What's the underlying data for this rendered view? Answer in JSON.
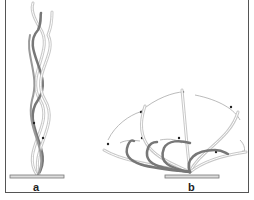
{
  "figure": {
    "panels": [
      {
        "id": "a",
        "label": "a",
        "description": "Twisted intertwined strands rising vertically from a base plate"
      },
      {
        "id": "b",
        "label": "b",
        "description": "Curved strands fanning out from a base plate with arrows indicating sweeping motion"
      }
    ],
    "colors": {
      "strand_light": "#bdbdbd",
      "strand_dark": "#6e6e6e",
      "arrow": "#9a9a9a",
      "frame": "#555555"
    }
  }
}
